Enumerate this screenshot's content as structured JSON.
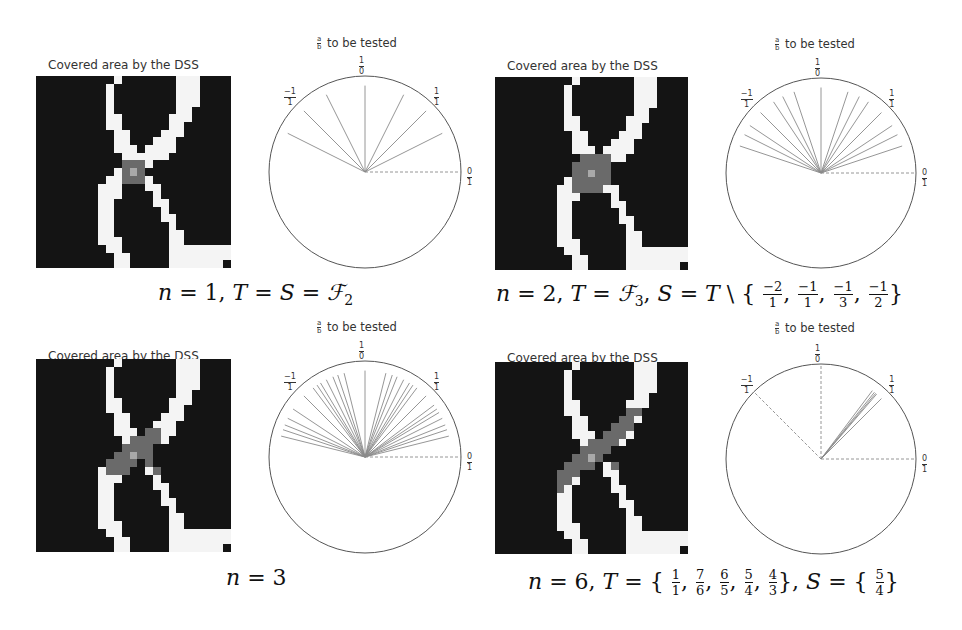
{
  "figure": {
    "panels": [
      {
        "id": "p1",
        "image_title": "Covered area by the DSS",
        "polar_title_suffix": "to be tested",
        "caption": "n = 1, T = S = ℱ₂",
        "caption_parts": {
          "n": "1",
          "T": "S = ℱ",
          "T_sub": "2"
        },
        "gray_region": "p1"
      },
      {
        "id": "p2",
        "image_title": "Covered area by the DSS",
        "polar_title_suffix": "to be tested",
        "caption": "n = 2, T = ℱ₃, S = T \\ {-2/1, -1/1, -1/3, -1/2}",
        "excluded": [
          [
            "−2",
            "1"
          ],
          [
            "−1",
            "1"
          ],
          [
            "−1",
            "3"
          ],
          [
            "−1",
            "2"
          ]
        ]
      },
      {
        "id": "p3",
        "image_title": "Covered area by the DSS",
        "polar_title_suffix": "to be tested",
        "caption": "n = 3"
      },
      {
        "id": "p4",
        "image_title": "Covered area by the DSS",
        "polar_title_suffix": "to be tested",
        "caption": "n = 6, T = {1/1, 7/6, 6/5, 5/4, 4/3}, S = {5/4}",
        "T": [
          [
            "1",
            "1"
          ],
          [
            "7",
            "6"
          ],
          [
            "6",
            "5"
          ],
          [
            "5",
            "4"
          ],
          [
            "4",
            "3"
          ]
        ],
        "S": [
          [
            "5",
            "4"
          ]
        ]
      }
    ],
    "polar_ticks": [
      {
        "num": "1",
        "den": "0",
        "angle_deg": 90
      },
      {
        "num": "−1",
        "den": "1",
        "angle_deg": 135
      },
      {
        "num": "1",
        "den": "1",
        "angle_deg": 45
      },
      {
        "num": "0",
        "den": "1",
        "angle_deg": 0
      }
    ],
    "polar_title_frac": {
      "num": "a",
      "den": "b"
    }
  },
  "chart_data": [
    {
      "type": "polar-lines",
      "title": "a/b to be tested",
      "panel": "n = 1",
      "ticks": [
        "0/1",
        "1/1",
        "1/0",
        "-1/1"
      ],
      "slopes_tested": [
        "0/1",
        "1/2",
        "1/1",
        "2/1",
        "1/0",
        "-2/1",
        "-1/1",
        "-1/2"
      ],
      "angles_deg": [
        0,
        26.6,
        45,
        63.4,
        90,
        116.6,
        135,
        153.4
      ]
    },
    {
      "type": "polar-lines",
      "title": "a/b to be tested",
      "panel": "n = 2",
      "ticks": [
        "0/1",
        "1/1",
        "1/0",
        "-1/1"
      ],
      "slopes_tested": [
        "0/1",
        "1/3",
        "1/2",
        "2/3",
        "1/1",
        "3/2",
        "2/1",
        "3/1",
        "1/0",
        "-3/1",
        "-2/1",
        "-3/2",
        "-1/1",
        "-2/3",
        "-1/2",
        "-1/3"
      ],
      "angles_deg": [
        0,
        18.4,
        26.6,
        33.7,
        45,
        56.3,
        63.4,
        71.6,
        90,
        108.4,
        116.6,
        123.7,
        135,
        146.3,
        153.4,
        161.6
      ]
    },
    {
      "type": "polar-lines",
      "title": "a/b to be tested",
      "panel": "n = 3",
      "ticks": [
        "0/1",
        "1/1",
        "1/0",
        "-1/1"
      ],
      "angles_deg": [
        0,
        14,
        18.4,
        21.8,
        26.6,
        31,
        33.7,
        36.9,
        45,
        53.1,
        56.3,
        59,
        63.4,
        68.2,
        71.6,
        76,
        90,
        104,
        108.4,
        111.8,
        116.6,
        121,
        123.7,
        126.9,
        135,
        146.3,
        153.4,
        158.2,
        161.6,
        166
      ]
    },
    {
      "type": "polar-lines",
      "title": "a/b to be tested",
      "panel": "n = 6",
      "ticks": [
        "0/1",
        "1/1",
        "1/0",
        "-1/1"
      ],
      "slopes_tested": [
        "1/1",
        "7/6",
        "6/5",
        "5/4",
        "4/3"
      ],
      "angles_deg": [
        45,
        49.4,
        50.2,
        51.3,
        53.1
      ]
    }
  ]
}
